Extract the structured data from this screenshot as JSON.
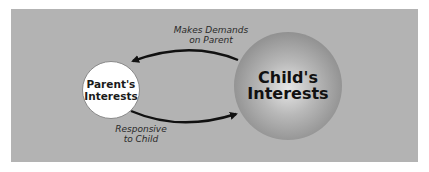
{
  "diagram": {
    "nodes": [
      {
        "id": "parent",
        "line1": "Parent's",
        "line2": "Interests",
        "style": "small white circle"
      },
      {
        "id": "child",
        "line1": "Child's",
        "line2": "Interests",
        "style": "large shaded sphere"
      }
    ],
    "edges": [
      {
        "from": "child",
        "to": "parent",
        "label_line1": "Makes Demands",
        "label_line2": "on Parent"
      },
      {
        "from": "parent",
        "to": "child",
        "label_line1": "Responsive",
        "label_line2": "to Child"
      }
    ],
    "colors": {
      "background_panel": "#b3b3b3",
      "parent_fill": "#ffffff",
      "child_center": "#e6e6e6",
      "child_edge": "#767676",
      "arrow": "#111111",
      "text": "#1a1a1a"
    }
  }
}
